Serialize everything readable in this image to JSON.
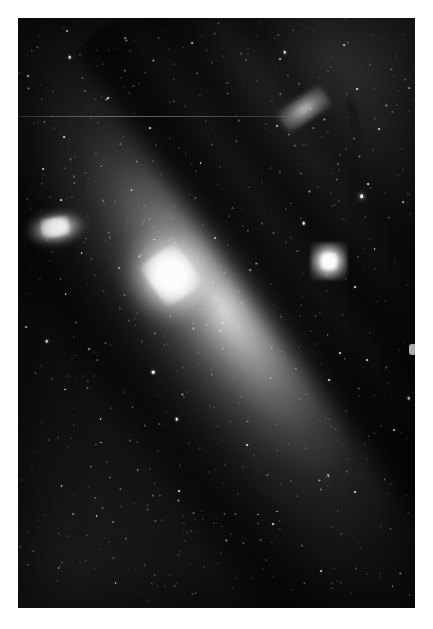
{
  "image": {
    "kind": "astronomical-photograph",
    "medium": "grayscale photographic plate",
    "subject": "Andromeda Galaxy (M31) with companion galaxies",
    "border_color": "#ffffff",
    "sky_color": "#0a0a0c",
    "highlight_color": "#ffffff",
    "width": 433,
    "height": 629,
    "field": {
      "left": 18,
      "top": 18,
      "width": 397,
      "height": 590
    }
  },
  "objects": [
    {
      "name": "m31",
      "label": "Andromeda Galaxy core",
      "type": "spiral-galaxy",
      "x_pct": 38.5,
      "y_pct": 43.5,
      "position_angle_deg": -36,
      "brightness": "very-bright"
    },
    {
      "name": "m110",
      "label": "companion elliptical galaxy (left)",
      "type": "elliptical-galaxy",
      "x_pct": 9.6,
      "y_pct": 35.6,
      "position_angle_deg": -9,
      "brightness": "bright"
    },
    {
      "name": "m32",
      "label": "companion elliptical galaxy (right)",
      "type": "elliptical-galaxy",
      "x_pct": 78.3,
      "y_pct": 41.2,
      "position_angle_deg": 0,
      "brightness": "bright"
    }
  ],
  "dust_lanes": [
    {
      "name": "dust-lane-outer",
      "angle_deg": -36
    },
    {
      "name": "dust-lane-middle",
      "angle_deg": -36
    },
    {
      "name": "dust-lane-inner",
      "angle_deg": -34
    },
    {
      "name": "dust-lane-south",
      "angle_deg": -36
    }
  ],
  "artifacts": [
    {
      "name": "scan-line",
      "y_pct": 16.6
    },
    {
      "name": "edge-emulsion-blob",
      "x_pct": 99.0,
      "y_pct": 55.2
    }
  ],
  "stars": [
    {
      "x": 5.2,
      "y": 3.1,
      "m": "dim"
    },
    {
      "x": 12.4,
      "y": 2.2,
      "m": "mid"
    },
    {
      "x": 19.8,
      "y": 5.4,
      "m": "dim"
    },
    {
      "x": 13.0,
      "y": 6.6,
      "m": "bright"
    },
    {
      "x": 27.3,
      "y": 3.8,
      "m": "dim"
    },
    {
      "x": 34.1,
      "y": 7.2,
      "m": "dim"
    },
    {
      "x": 43.8,
      "y": 4.2,
      "m": "mid"
    },
    {
      "x": 49.6,
      "y": 2.6,
      "m": "dim"
    },
    {
      "x": 56.2,
      "y": 6.0,
      "m": "dim"
    },
    {
      "x": 64.8,
      "y": 3.4,
      "m": "dim"
    },
    {
      "x": 67.2,
      "y": 5.8,
      "m": "bright"
    },
    {
      "x": 74.5,
      "y": 2.0,
      "m": "dim"
    },
    {
      "x": 82.1,
      "y": 4.6,
      "m": "mid"
    },
    {
      "x": 89.4,
      "y": 2.8,
      "m": "dim"
    },
    {
      "x": 95.2,
      "y": 6.4,
      "m": "dim"
    },
    {
      "x": 2.6,
      "y": 9.8,
      "m": "mid"
    },
    {
      "x": 8.8,
      "y": 12.4,
      "m": "dim"
    },
    {
      "x": 16.2,
      "y": 10.2,
      "m": "dim"
    },
    {
      "x": 22.6,
      "y": 13.6,
      "m": "mid"
    },
    {
      "x": 30.4,
      "y": 11.0,
      "m": "dim"
    },
    {
      "x": 38.2,
      "y": 14.2,
      "m": "dim"
    },
    {
      "x": 45.0,
      "y": 9.4,
      "m": "dim"
    },
    {
      "x": 52.8,
      "y": 12.8,
      "m": "mid"
    },
    {
      "x": 60.2,
      "y": 10.6,
      "m": "dim"
    },
    {
      "x": 70.6,
      "y": 13.2,
      "m": "dim"
    },
    {
      "x": 78.0,
      "y": 9.0,
      "m": "dim"
    },
    {
      "x": 85.4,
      "y": 12.0,
      "m": "mid"
    },
    {
      "x": 92.8,
      "y": 14.8,
      "m": "dim"
    },
    {
      "x": 97.4,
      "y": 10.4,
      "m": "dim"
    },
    {
      "x": 4.0,
      "y": 17.8,
      "m": "dim"
    },
    {
      "x": 11.6,
      "y": 20.2,
      "m": "mid"
    },
    {
      "x": 18.4,
      "y": 17.0,
      "m": "dim"
    },
    {
      "x": 25.8,
      "y": 21.4,
      "m": "dim"
    },
    {
      "x": 33.2,
      "y": 18.6,
      "m": "mid"
    },
    {
      "x": 40.6,
      "y": 22.0,
      "m": "dim"
    },
    {
      "x": 47.4,
      "y": 17.4,
      "m": "dim"
    },
    {
      "x": 55.0,
      "y": 20.8,
      "m": "dim"
    },
    {
      "x": 62.4,
      "y": 18.0,
      "m": "dim"
    },
    {
      "x": 69.8,
      "y": 21.6,
      "m": "dim"
    },
    {
      "x": 77.2,
      "y": 17.2,
      "m": "dim"
    },
    {
      "x": 84.6,
      "y": 20.4,
      "m": "dim"
    },
    {
      "x": 91.0,
      "y": 18.8,
      "m": "mid"
    },
    {
      "x": 96.8,
      "y": 22.2,
      "m": "dim"
    },
    {
      "x": 6.4,
      "y": 25.6,
      "m": "mid"
    },
    {
      "x": 14.2,
      "y": 28.0,
      "m": "dim"
    },
    {
      "x": 21.0,
      "y": 25.0,
      "m": "dim"
    },
    {
      "x": 28.6,
      "y": 29.2,
      "m": "mid"
    },
    {
      "x": 36.0,
      "y": 26.4,
      "m": "dim"
    },
    {
      "x": 43.4,
      "y": 29.8,
      "m": "dim"
    },
    {
      "x": 50.8,
      "y": 25.2,
      "m": "dim"
    },
    {
      "x": 58.2,
      "y": 28.6,
      "m": "dim"
    },
    {
      "x": 66.0,
      "y": 26.0,
      "m": "dim"
    },
    {
      "x": 73.4,
      "y": 29.4,
      "m": "dim"
    },
    {
      "x": 80.8,
      "y": 25.8,
      "m": "dim"
    },
    {
      "x": 88.2,
      "y": 28.2,
      "m": "mid"
    },
    {
      "x": 95.6,
      "y": 26.6,
      "m": "dim"
    },
    {
      "x": 3.2,
      "y": 32.4,
      "m": "dim"
    },
    {
      "x": 10.8,
      "y": 30.8,
      "m": "mid"
    },
    {
      "x": 17.6,
      "y": 33.6,
      "m": "dim"
    },
    {
      "x": 24.4,
      "y": 31.0,
      "m": "dim"
    },
    {
      "x": 31.8,
      "y": 34.4,
      "m": "dim"
    },
    {
      "x": 39.2,
      "y": 31.8,
      "m": "dim"
    },
    {
      "x": 46.6,
      "y": 35.0,
      "m": "dim"
    },
    {
      "x": 54.0,
      "y": 32.2,
      "m": "dim"
    },
    {
      "x": 61.4,
      "y": 34.8,
      "m": "dim"
    },
    {
      "x": 68.8,
      "y": 31.4,
      "m": "dim"
    },
    {
      "x": 86.6,
      "y": 30.2,
      "m": "vbright"
    },
    {
      "x": 93.4,
      "y": 33.8,
      "m": "dim"
    },
    {
      "x": 97.0,
      "y": 31.2,
      "m": "mid"
    },
    {
      "x": 1.8,
      "y": 38.6,
      "m": "dim"
    },
    {
      "x": 16.0,
      "y": 39.8,
      "m": "mid"
    },
    {
      "x": 23.2,
      "y": 37.2,
      "m": "dim"
    },
    {
      "x": 30.6,
      "y": 40.4,
      "m": "dim"
    },
    {
      "x": 38.0,
      "y": 37.8,
      "m": "dim"
    },
    {
      "x": 45.4,
      "y": 41.0,
      "m": "dim"
    },
    {
      "x": 52.8,
      "y": 38.4,
      "m": "dim"
    },
    {
      "x": 60.0,
      "y": 41.6,
      "m": "dim"
    },
    {
      "x": 67.4,
      "y": 38.0,
      "m": "dim"
    },
    {
      "x": 72.0,
      "y": 34.8,
      "m": "bright"
    },
    {
      "x": 89.8,
      "y": 39.2,
      "m": "mid"
    },
    {
      "x": 95.0,
      "y": 41.4,
      "m": "dim"
    },
    {
      "x": 5.6,
      "y": 44.2,
      "m": "dim"
    },
    {
      "x": 12.0,
      "y": 46.8,
      "m": "mid"
    },
    {
      "x": 19.4,
      "y": 43.6,
      "m": "dim"
    },
    {
      "x": 26.8,
      "y": 47.0,
      "m": "dim"
    },
    {
      "x": 34.2,
      "y": 44.4,
      "m": "dim"
    },
    {
      "x": 41.6,
      "y": 47.8,
      "m": "dim"
    },
    {
      "x": 49.0,
      "y": 44.8,
      "m": "dim"
    },
    {
      "x": 56.4,
      "y": 48.2,
      "m": "dim"
    },
    {
      "x": 63.8,
      "y": 45.0,
      "m": "dim"
    },
    {
      "x": 71.2,
      "y": 48.6,
      "m": "dim"
    },
    {
      "x": 85.0,
      "y": 45.6,
      "m": "mid"
    },
    {
      "x": 92.4,
      "y": 48.0,
      "m": "dim"
    },
    {
      "x": 98.0,
      "y": 45.2,
      "m": "dim"
    },
    {
      "x": 2.0,
      "y": 52.4,
      "m": "mid"
    },
    {
      "x": 7.2,
      "y": 54.8,
      "m": "bright"
    },
    {
      "x": 14.6,
      "y": 51.6,
      "m": "dim"
    },
    {
      "x": 22.0,
      "y": 55.0,
      "m": "dim"
    },
    {
      "x": 29.4,
      "y": 52.0,
      "m": "dim"
    },
    {
      "x": 36.8,
      "y": 55.4,
      "m": "dim"
    },
    {
      "x": 44.2,
      "y": 52.6,
      "m": "dim"
    },
    {
      "x": 51.6,
      "y": 56.0,
      "m": "dim"
    },
    {
      "x": 59.0,
      "y": 53.2,
      "m": "dim"
    },
    {
      "x": 66.4,
      "y": 56.4,
      "m": "dim"
    },
    {
      "x": 73.8,
      "y": 53.0,
      "m": "dim"
    },
    {
      "x": 81.2,
      "y": 56.8,
      "m": "mid"
    },
    {
      "x": 88.6,
      "y": 53.4,
      "m": "dim"
    },
    {
      "x": 96.0,
      "y": 56.2,
      "m": "dim"
    },
    {
      "x": 4.4,
      "y": 60.2,
      "m": "dim"
    },
    {
      "x": 11.8,
      "y": 63.0,
      "m": "mid"
    },
    {
      "x": 19.2,
      "y": 60.6,
      "m": "dim"
    },
    {
      "x": 26.6,
      "y": 63.4,
      "m": "dim"
    },
    {
      "x": 34.0,
      "y": 60.0,
      "m": "bright"
    },
    {
      "x": 41.4,
      "y": 63.8,
      "m": "dim"
    },
    {
      "x": 48.8,
      "y": 60.4,
      "m": "dim"
    },
    {
      "x": 56.2,
      "y": 64.2,
      "m": "dim"
    },
    {
      "x": 63.6,
      "y": 61.0,
      "m": "dim"
    },
    {
      "x": 71.0,
      "y": 64.6,
      "m": "dim"
    },
    {
      "x": 78.4,
      "y": 61.4,
      "m": "mid"
    },
    {
      "x": 85.8,
      "y": 64.0,
      "m": "dim"
    },
    {
      "x": 93.2,
      "y": 61.8,
      "m": "dim"
    },
    {
      "x": 98.4,
      "y": 64.4,
      "m": "bright"
    },
    {
      "x": 6.0,
      "y": 68.4,
      "m": "dim"
    },
    {
      "x": 13.4,
      "y": 71.2,
      "m": "dim"
    },
    {
      "x": 20.8,
      "y": 68.0,
      "m": "mid"
    },
    {
      "x": 28.2,
      "y": 71.6,
      "m": "dim"
    },
    {
      "x": 35.6,
      "y": 68.8,
      "m": "dim"
    },
    {
      "x": 43.0,
      "y": 72.0,
      "m": "dim"
    },
    {
      "x": 50.4,
      "y": 69.2,
      "m": "dim"
    },
    {
      "x": 57.8,
      "y": 72.4,
      "m": "mid"
    },
    {
      "x": 65.2,
      "y": 69.0,
      "m": "dim"
    },
    {
      "x": 72.6,
      "y": 72.8,
      "m": "dim"
    },
    {
      "x": 80.0,
      "y": 69.6,
      "m": "dim"
    },
    {
      "x": 87.4,
      "y": 72.2,
      "m": "dim"
    },
    {
      "x": 94.8,
      "y": 69.8,
      "m": "mid"
    },
    {
      "x": 3.6,
      "y": 76.6,
      "m": "dim"
    },
    {
      "x": 11.0,
      "y": 79.4,
      "m": "mid"
    },
    {
      "x": 18.4,
      "y": 76.0,
      "m": "dim"
    },
    {
      "x": 25.8,
      "y": 79.8,
      "m": "dim"
    },
    {
      "x": 33.2,
      "y": 76.4,
      "m": "dim"
    },
    {
      "x": 40.6,
      "y": 80.2,
      "m": "mid"
    },
    {
      "x": 48.0,
      "y": 77.0,
      "m": "dim"
    },
    {
      "x": 55.4,
      "y": 80.6,
      "m": "dim"
    },
    {
      "x": 62.8,
      "y": 77.4,
      "m": "dim"
    },
    {
      "x": 70.2,
      "y": 81.0,
      "m": "dim"
    },
    {
      "x": 77.6,
      "y": 77.8,
      "m": "dim"
    },
    {
      "x": 85.0,
      "y": 80.4,
      "m": "mid"
    },
    {
      "x": 92.4,
      "y": 78.2,
      "m": "dim"
    },
    {
      "x": 97.8,
      "y": 80.8,
      "m": "dim"
    },
    {
      "x": 5.0,
      "y": 85.0,
      "m": "dim"
    },
    {
      "x": 12.4,
      "y": 87.8,
      "m": "dim"
    },
    {
      "x": 19.8,
      "y": 84.4,
      "m": "mid"
    },
    {
      "x": 27.2,
      "y": 88.2,
      "m": "dim"
    },
    {
      "x": 34.6,
      "y": 85.2,
      "m": "dim"
    },
    {
      "x": 42.0,
      "y": 88.6,
      "m": "dim"
    },
    {
      "x": 49.4,
      "y": 85.6,
      "m": "dim"
    },
    {
      "x": 56.8,
      "y": 89.0,
      "m": "dim"
    },
    {
      "x": 64.2,
      "y": 85.8,
      "m": "mid"
    },
    {
      "x": 71.6,
      "y": 89.4,
      "m": "dim"
    },
    {
      "x": 79.0,
      "y": 86.2,
      "m": "dim"
    },
    {
      "x": 86.4,
      "y": 89.8,
      "m": "dim"
    },
    {
      "x": 93.8,
      "y": 86.6,
      "m": "dim"
    },
    {
      "x": 2.4,
      "y": 92.6,
      "m": "dim"
    },
    {
      "x": 9.8,
      "y": 95.4,
      "m": "dim"
    },
    {
      "x": 17.2,
      "y": 92.0,
      "m": "dim"
    },
    {
      "x": 24.6,
      "y": 95.8,
      "m": "mid"
    },
    {
      "x": 32.0,
      "y": 92.8,
      "m": "dim"
    },
    {
      "x": 39.4,
      "y": 96.2,
      "m": "dim"
    },
    {
      "x": 46.8,
      "y": 93.0,
      "m": "dim"
    },
    {
      "x": 54.2,
      "y": 96.6,
      "m": "dim"
    },
    {
      "x": 61.6,
      "y": 93.4,
      "m": "dim"
    },
    {
      "x": 69.0,
      "y": 97.0,
      "m": "dim"
    },
    {
      "x": 76.4,
      "y": 93.8,
      "m": "mid"
    },
    {
      "x": 83.8,
      "y": 97.4,
      "m": "dim"
    },
    {
      "x": 91.2,
      "y": 94.2,
      "m": "dim"
    },
    {
      "x": 98.6,
      "y": 97.8,
      "m": "dim"
    },
    {
      "x": 8.0,
      "y": 41.2,
      "m": "dim"
    },
    {
      "x": 21.6,
      "y": 24.0,
      "m": "dim"
    },
    {
      "x": 40.0,
      "y": 68.0,
      "m": "bright"
    },
    {
      "x": 58.0,
      "y": 36.0,
      "m": "dim"
    },
    {
      "x": 76.0,
      "y": 50.0,
      "m": "dim"
    },
    {
      "x": 30.0,
      "y": 50.0,
      "m": "dim"
    },
    {
      "x": 46.0,
      "y": 24.6,
      "m": "mid"
    },
    {
      "x": 64.0,
      "y": 14.0,
      "m": "dim"
    },
    {
      "x": 82.0,
      "y": 34.0,
      "m": "dim"
    },
    {
      "x": 88.0,
      "y": 58.0,
      "m": "mid"
    },
    {
      "x": 20.0,
      "y": 58.0,
      "m": "dim"
    },
    {
      "x": 52.0,
      "y": 84.0,
      "m": "dim"
    }
  ]
}
